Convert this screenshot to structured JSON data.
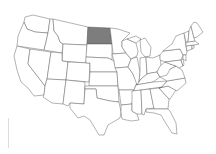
{
  "map": {
    "title": "United States",
    "highlighted_state": "North Dakota",
    "colors": {
      "background": "#ffffff",
      "state_fill": "#ffffff",
      "state_border": "#555555",
      "highlight_fill": "#7d7d7d"
    },
    "states": [
      {
        "name": "Washington",
        "highlighted": false
      },
      {
        "name": "Oregon",
        "highlighted": false
      },
      {
        "name": "California",
        "highlighted": false
      },
      {
        "name": "Idaho",
        "highlighted": false
      },
      {
        "name": "Nevada",
        "highlighted": false
      },
      {
        "name": "Montana",
        "highlighted": false
      },
      {
        "name": "Wyoming",
        "highlighted": false
      },
      {
        "name": "Utah",
        "highlighted": false
      },
      {
        "name": "Arizona",
        "highlighted": false
      },
      {
        "name": "Colorado",
        "highlighted": false
      },
      {
        "name": "New Mexico",
        "highlighted": false
      },
      {
        "name": "North Dakota",
        "highlighted": true
      },
      {
        "name": "South Dakota",
        "highlighted": false
      },
      {
        "name": "Nebraska",
        "highlighted": false
      },
      {
        "name": "Kansas",
        "highlighted": false
      },
      {
        "name": "Oklahoma",
        "highlighted": false
      },
      {
        "name": "Texas",
        "highlighted": false
      },
      {
        "name": "Minnesota",
        "highlighted": false
      },
      {
        "name": "Iowa",
        "highlighted": false
      },
      {
        "name": "Missouri",
        "highlighted": false
      },
      {
        "name": "Arkansas",
        "highlighted": false
      },
      {
        "name": "Louisiana",
        "highlighted": false
      },
      {
        "name": "Wisconsin",
        "highlighted": false
      },
      {
        "name": "Illinois",
        "highlighted": false
      },
      {
        "name": "Michigan",
        "highlighted": false
      },
      {
        "name": "Indiana",
        "highlighted": false
      },
      {
        "name": "Ohio",
        "highlighted": false
      },
      {
        "name": "Kentucky",
        "highlighted": false
      },
      {
        "name": "Tennessee",
        "highlighted": false
      },
      {
        "name": "Mississippi",
        "highlighted": false
      },
      {
        "name": "Alabama",
        "highlighted": false
      },
      {
        "name": "Georgia",
        "highlighted": false
      },
      {
        "name": "Florida",
        "highlighted": false
      },
      {
        "name": "South Carolina",
        "highlighted": false
      },
      {
        "name": "North Carolina",
        "highlighted": false
      },
      {
        "name": "Virginia",
        "highlighted": false
      },
      {
        "name": "West Virginia",
        "highlighted": false
      },
      {
        "name": "Pennsylvania",
        "highlighted": false
      },
      {
        "name": "New York",
        "highlighted": false
      },
      {
        "name": "Maryland",
        "highlighted": false
      },
      {
        "name": "Delaware",
        "highlighted": false
      },
      {
        "name": "New Jersey",
        "highlighted": false
      },
      {
        "name": "Connecticut",
        "highlighted": false
      },
      {
        "name": "Rhode Island",
        "highlighted": false
      },
      {
        "name": "Massachusetts",
        "highlighted": false
      },
      {
        "name": "Vermont",
        "highlighted": false
      },
      {
        "name": "New Hampshire",
        "highlighted": false
      },
      {
        "name": "Maine",
        "highlighted": false
      }
    ]
  }
}
